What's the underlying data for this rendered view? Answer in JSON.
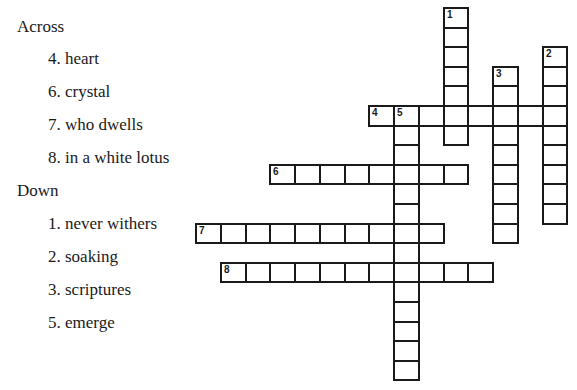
{
  "clues": {
    "across_heading": "Across",
    "down_heading": "Down",
    "across": [
      {
        "number": 4,
        "text": "4. heart"
      },
      {
        "number": 6,
        "text": "6. crystal"
      },
      {
        "number": 7,
        "text": "7. who dwells"
      },
      {
        "number": 8,
        "text": "8. in a white lotus"
      }
    ],
    "down": [
      {
        "number": 1,
        "text": "1. never withers"
      },
      {
        "number": 2,
        "text": "2. soaking"
      },
      {
        "number": 3,
        "text": "3. scriptures"
      },
      {
        "number": 5,
        "text": "5. emerge"
      }
    ]
  },
  "grid": {
    "origin_x": 195,
    "origin_y": 7,
    "cell_w": 24.75,
    "cell_h": 19.6,
    "entries": [
      {
        "number": 1,
        "dir": "down",
        "row": 0,
        "col": 10,
        "length": 7
      },
      {
        "number": 2,
        "dir": "down",
        "row": 2,
        "col": 14,
        "length": 9
      },
      {
        "number": 3,
        "dir": "down",
        "row": 3,
        "col": 12,
        "length": 9
      },
      {
        "number": 4,
        "dir": "across",
        "row": 5,
        "col": 7,
        "length": 8
      },
      {
        "number": 5,
        "dir": "down",
        "row": 5,
        "col": 8,
        "length": 14
      },
      {
        "number": 6,
        "dir": "across",
        "row": 8,
        "col": 3,
        "length": 8
      },
      {
        "number": 7,
        "dir": "across",
        "row": 11,
        "col": 0,
        "length": 10
      },
      {
        "number": 8,
        "dir": "across",
        "row": 13,
        "col": 1,
        "length": 11
      }
    ]
  }
}
